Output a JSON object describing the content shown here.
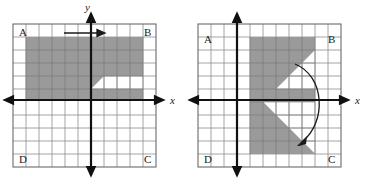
{
  "figure_left": {
    "name": "translation-figure",
    "corner_labels": {
      "top_left": "A",
      "top_right": "B",
      "bottom_right": "C",
      "bottom_left": "D"
    },
    "axis_labels": {
      "x": "x",
      "y": "y"
    },
    "transform_arrow": "horizontal-translation-arrow",
    "shape": "z-shape",
    "grid": {
      "cols": 11,
      "rows": 11
    },
    "shade_color": "#9a9a9a"
  },
  "figure_right": {
    "name": "rotation-figure",
    "corner_labels": {
      "top_left": "A",
      "top_right": "B",
      "bottom_right": "C",
      "bottom_left": "D"
    },
    "axis_labels": {
      "x": "x",
      "y": "y"
    },
    "transform_arrow": "clockwise-rotation-arrow",
    "shape": "z-shape-rotated-90-clockwise",
    "grid": {
      "cols": 11,
      "rows": 11
    },
    "shade_color": "#9a9a9a"
  },
  "colors": {
    "shade": "#9a9a9a",
    "grid_line": "#8e8e8e",
    "grid_border": "#6b6b6b",
    "axis": "#111111",
    "text": "#1a1a1a",
    "background": "#ffffff"
  }
}
